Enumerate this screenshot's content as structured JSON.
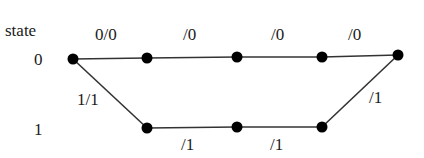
{
  "diagram": {
    "type": "trellis",
    "axis_label": "state",
    "state_labels": [
      {
        "text": "0",
        "x": 34,
        "y": 51
      },
      {
        "text": "1",
        "x": 34,
        "y": 121
      }
    ],
    "nodes": [
      {
        "id": "t0s0",
        "x": 73,
        "y": 59
      },
      {
        "id": "t1s0",
        "x": 147,
        "y": 58
      },
      {
        "id": "t2s0",
        "x": 237,
        "y": 57
      },
      {
        "id": "t3s0",
        "x": 322,
        "y": 57
      },
      {
        "id": "t4s0",
        "x": 398,
        "y": 55
      },
      {
        "id": "t1s1",
        "x": 147,
        "y": 128
      },
      {
        "id": "t2s1",
        "x": 237,
        "y": 127
      },
      {
        "id": "t3s1",
        "x": 322,
        "y": 127
      }
    ],
    "edges": [
      {
        "from": "t0s0",
        "to": "t1s0",
        "label": "0/0"
      },
      {
        "from": "t1s0",
        "to": "t2s0",
        "label": "/0"
      },
      {
        "from": "t2s0",
        "to": "t3s0",
        "label": "/0"
      },
      {
        "from": "t3s0",
        "to": "t4s0",
        "label": "/0"
      },
      {
        "from": "t0s0",
        "to": "t1s1",
        "label": "1/1"
      },
      {
        "from": "t1s1",
        "to": "t2s1",
        "label": "/1"
      },
      {
        "from": "t2s1",
        "to": "t3s1",
        "label": "/1"
      },
      {
        "from": "t3s1",
        "to": "t4s0",
        "label": "/1"
      }
    ],
    "edge_labels": [
      {
        "text": "0/0",
        "x": 95,
        "y": 26
      },
      {
        "text": "/0",
        "x": 183,
        "y": 26
      },
      {
        "text": "/0",
        "x": 271,
        "y": 26
      },
      {
        "text": "/0",
        "x": 348,
        "y": 26
      },
      {
        "text": "1/1",
        "x": 77,
        "y": 91
      },
      {
        "text": "/1",
        "x": 181,
        "y": 136
      },
      {
        "text": "/1",
        "x": 270,
        "y": 136
      },
      {
        "text": "/1",
        "x": 369,
        "y": 89
      }
    ],
    "colors": {
      "line": "#333333",
      "node": "#000000",
      "text": "#1a1a1a"
    }
  }
}
